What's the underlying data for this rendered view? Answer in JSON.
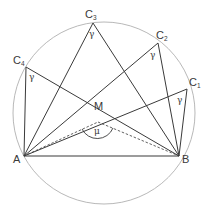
{
  "diagram": {
    "colors": {
      "circle": "#b0b0b0",
      "lines": "#3a3a3a",
      "dashed": "#3a3a3a",
      "background": "#ffffff"
    },
    "labels": {
      "A": "A",
      "B": "B",
      "M": "M",
      "C1": "C",
      "C1_sub": "1",
      "C2": "C",
      "C2_sub": "2",
      "C3": "C",
      "C3_sub": "3",
      "C4": "C",
      "C4_sub": "4",
      "gamma": "γ",
      "mu": "μ"
    },
    "points": {
      "A": [
        24,
        156
      ],
      "B": [
        179,
        156
      ],
      "C1": [
        187,
        89
      ],
      "C2": [
        158,
        43
      ],
      "C3": [
        93,
        23
      ],
      "C4": [
        26,
        67
      ],
      "M": [
        98,
        122
      ],
      "circle_center": [
        104,
        113
      ],
      "circle_radius": 91
    },
    "angles": [
      {
        "vertex": "C1",
        "label": "γ"
      },
      {
        "vertex": "C2",
        "label": "γ"
      },
      {
        "vertex": "C3",
        "label": "γ"
      },
      {
        "vertex": "C4",
        "label": "γ"
      },
      {
        "vertex": "M",
        "label": "μ",
        "note": "central angle AMB (dashed)"
      }
    ]
  }
}
